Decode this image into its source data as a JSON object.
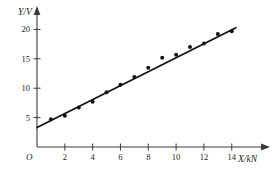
{
  "chart_data": {
    "type": "scatter",
    "title": "",
    "subtitle": "",
    "xlabel": "X/kN",
    "ylabel": "Y/V",
    "origin_label": "O",
    "xlim": [
      0,
      15.6
    ],
    "ylim": [
      0,
      21.6
    ],
    "grid": false,
    "legend": null,
    "x_ticks": [
      2,
      4,
      6,
      8,
      10,
      12,
      14
    ],
    "x_tick_labels": [
      "2",
      "4",
      "6",
      "8",
      "10",
      "12",
      "14"
    ],
    "y_ticks": [
      5,
      10,
      15,
      20
    ],
    "y_tick_labels": [
      "5",
      "10",
      "15",
      "20"
    ],
    "points": [
      {
        "x": 1,
        "y": 4.7
      },
      {
        "x": 2,
        "y": 5.3
      },
      {
        "x": 3,
        "y": 6.7
      },
      {
        "x": 4,
        "y": 7.7
      },
      {
        "x": 5,
        "y": 9.3
      },
      {
        "x": 6,
        "y": 10.6
      },
      {
        "x": 7,
        "y": 11.9
      },
      {
        "x": 8,
        "y": 13.5
      },
      {
        "x": 9,
        "y": 15.2
      },
      {
        "x": 10,
        "y": 15.7
      },
      {
        "x": 11,
        "y": 17.0
      },
      {
        "x": 12,
        "y": 17.6
      },
      {
        "x": 13,
        "y": 19.2
      },
      {
        "x": 14,
        "y": 19.7
      }
    ],
    "series": [
      {
        "name": "measured",
        "type": "scatter",
        "x": [
          1,
          2,
          3,
          4,
          5,
          6,
          7,
          8,
          9,
          10,
          11,
          12,
          13,
          14
        ],
        "values": [
          4.7,
          5.3,
          6.7,
          7.7,
          9.3,
          10.6,
          11.9,
          13.5,
          15.2,
          15.7,
          17.0,
          17.6,
          19.2,
          19.7
        ]
      },
      {
        "name": "best-fit line",
        "type": "line",
        "x": [
          0,
          14.3
        ],
        "values": [
          3.3,
          20.3
        ],
        "slope": 1.19,
        "intercept": 3.3
      }
    ],
    "annotations": []
  }
}
